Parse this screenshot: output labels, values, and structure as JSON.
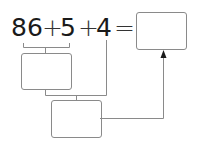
{
  "equation": {
    "terms": [
      "86",
      "5",
      "4"
    ],
    "operators": [
      "+",
      "+"
    ],
    "equals": "="
  },
  "boxes": {
    "answer_box": "",
    "step1_box": "",
    "step2_box": ""
  },
  "colors": {
    "text": "#1a1a1a",
    "lines": "#8a8a8a"
  }
}
